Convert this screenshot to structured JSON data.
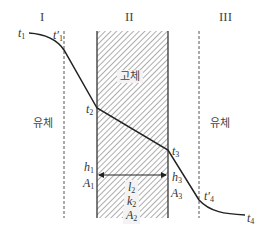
{
  "regions": {
    "left": {
      "roman": "I",
      "medium": "유체"
    },
    "middle": {
      "roman": "II",
      "medium": "고체"
    },
    "right": {
      "roman": "III",
      "medium": "유체"
    }
  },
  "temperatures": {
    "t1": {
      "base": "t",
      "sub": "1"
    },
    "t1p": {
      "base": "t′",
      "sub": "1"
    },
    "t2": {
      "base": "t",
      "sub": "2"
    },
    "t3": {
      "base": "t",
      "sub": "3"
    },
    "t4p": {
      "base": "t′",
      "sub": "4"
    },
    "t4": {
      "base": "t",
      "sub": "4"
    }
  },
  "left_surface": {
    "h": {
      "base": "h",
      "sub": "1"
    },
    "A": {
      "base": "A",
      "sub": "1"
    }
  },
  "wall": {
    "l": {
      "base": "l",
      "sub": "2"
    },
    "k": {
      "base": "k",
      "sub": "2"
    },
    "A": {
      "base": "A",
      "sub": "2"
    }
  },
  "right_surface": {
    "h": {
      "base": "h",
      "sub": "3"
    },
    "A": {
      "base": "A",
      "sub": "3"
    }
  },
  "colors": {
    "line": "#222222",
    "hatch": "#888888",
    "wall_border": "#333333",
    "dashed": "#555555"
  },
  "geometry": {
    "wall_left_x": 97,
    "wall_right_x": 168,
    "wall_top_y": 31,
    "wall_bottom_y": 218,
    "dash_left_x": 64,
    "dash_right_x": 199
  }
}
